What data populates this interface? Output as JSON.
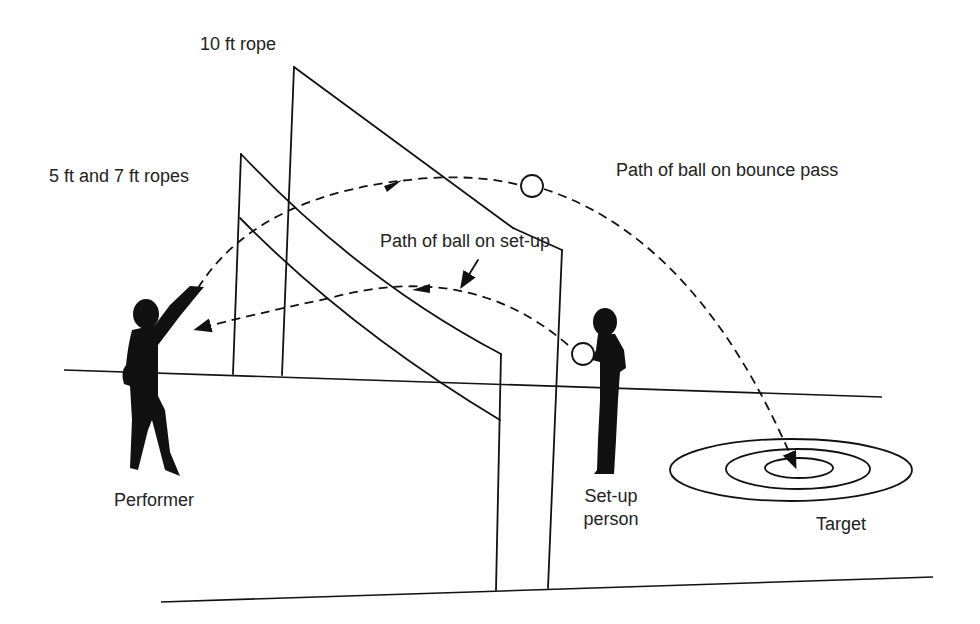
{
  "diagram": {
    "colors": {
      "ink": "#111111",
      "background": "#ffffff",
      "text": "#222222"
    },
    "labels": {
      "rope_10ft": "10 ft rope",
      "ropes_5_7ft": "5 ft and 7 ft ropes",
      "bounce_pass_path": "Path of ball on bounce pass",
      "setup_path": "Path of ball on set-up",
      "performer": "Performer",
      "setup_person_line1": "Set-up",
      "setup_person_line2": "person",
      "target": "Target"
    },
    "elements": {
      "ropes": [
        {
          "name": "5 ft rope",
          "height_ft": 5
        },
        {
          "name": "7 ft rope",
          "height_ft": 7
        },
        {
          "name": "10 ft rope",
          "height_ft": 10
        }
      ],
      "paths": [
        {
          "name": "bounce pass",
          "from": "Performer",
          "to": "Target",
          "style": "dashed"
        },
        {
          "name": "set-up",
          "from": "Set-up person",
          "to": "Performer",
          "style": "dashed"
        }
      ],
      "target_rings": 3,
      "people": [
        "Performer",
        "Set-up person"
      ]
    }
  }
}
